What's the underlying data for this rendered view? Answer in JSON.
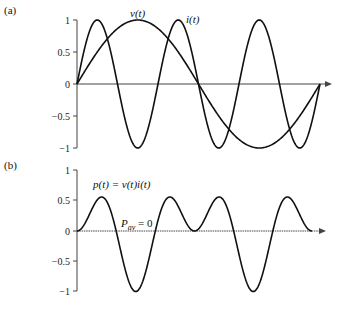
{
  "chart_data": [
    {
      "panel": "(a)",
      "type": "line",
      "title": "",
      "xlabel": "",
      "ylabel": "",
      "ylim": [
        -1,
        1
      ],
      "yticks": [
        1,
        0.5,
        0,
        -0.5,
        -1
      ],
      "ytick_labels": [
        "1",
        "0.5",
        "0",
        "−0.5",
        "−1"
      ],
      "grid": false,
      "x_domain": [
        0,
        1
      ],
      "x_unit": "one period of v(t)",
      "series": [
        {
          "name": "v(t)",
          "function": "sin(2*pi*x)",
          "label": "v(t)"
        },
        {
          "name": "i(t)",
          "function": "sin(6*pi*x)",
          "label": "i(t)"
        }
      ]
    },
    {
      "panel": "(b)",
      "type": "line",
      "title": "",
      "xlabel": "",
      "ylabel": "",
      "ylim": [
        -1,
        1
      ],
      "yticks": [
        1,
        0.5,
        0,
        -0.5,
        -1
      ],
      "ytick_labels": [
        "1",
        "0.5",
        "0",
        "−0.5",
        "−1"
      ],
      "grid": false,
      "x_domain": [
        0,
        1
      ],
      "series": [
        {
          "name": "p(t)",
          "function": "sin(2*pi*x)*sin(6*pi*x)",
          "label": "p(t) = v(t)i(t)"
        }
      ],
      "annotations": [
        {
          "text": "P",
          "subscript": "av",
          "suffix": " = 0"
        }
      ]
    }
  ],
  "panels": {
    "a": {
      "label": "(a)",
      "v_label": "v(t)",
      "i_label": "i(t)"
    },
    "b": {
      "label": "(b)",
      "p_label": "p(t) = v(t)i(t)",
      "pav_main": "P",
      "pav_sub": "av",
      "pav_rest": " = 0"
    }
  },
  "ticks": [
    "1",
    "0.5",
    "0",
    "−0.5",
    "−1"
  ]
}
